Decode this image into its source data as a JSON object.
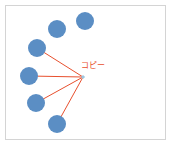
{
  "diagram": {
    "label": "コピー",
    "colors": {
      "node": "#5b8ec4",
      "edge": "#e8502e",
      "anchor": "#9cc6e0",
      "frame": "#d4d4d4"
    },
    "anchor": {
      "x": 83,
      "y": 77
    },
    "label_pos": {
      "x": 81,
      "y": 59
    },
    "nodes": [
      {
        "x": 85,
        "y": 21,
        "r": 9,
        "connected": false
      },
      {
        "x": 57,
        "y": 29,
        "r": 9,
        "connected": false
      },
      {
        "x": 37,
        "y": 48,
        "r": 9,
        "connected": true
      },
      {
        "x": 29,
        "y": 76,
        "r": 9,
        "connected": true
      },
      {
        "x": 36,
        "y": 103,
        "r": 9,
        "connected": true
      },
      {
        "x": 57,
        "y": 124,
        "r": 9,
        "connected": true
      }
    ]
  }
}
